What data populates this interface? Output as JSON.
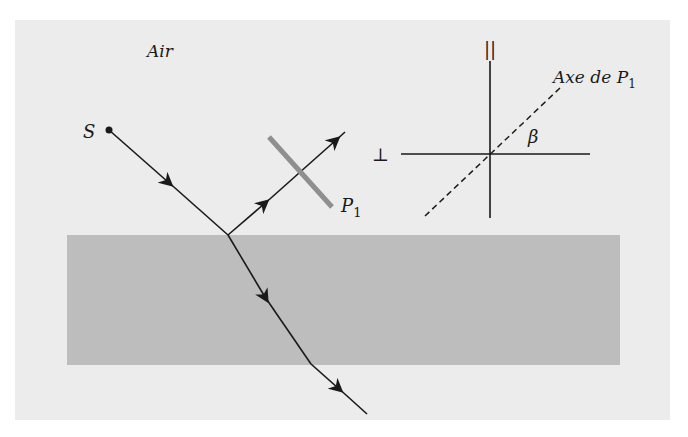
{
  "diagram": {
    "colors": {
      "background": "#ffffff",
      "air_panel": "#ececec",
      "slab": "#bdbdbd",
      "polarizer": "#8f8f8f",
      "ray": "#1a1a1a"
    },
    "labels": {
      "medium": "Air",
      "source": "S",
      "polarizer_letter": "P",
      "polarizer_sub": "1",
      "parallel_symbol": "||",
      "perp_symbol": "⊥",
      "axis_label_main": "Axe de P",
      "axis_label_sub": "1",
      "angle": "β"
    },
    "geometry": {
      "panel": {
        "x": 15,
        "y": 20,
        "w": 655,
        "h": 400
      },
      "slab": {
        "x": 67,
        "y": 235,
        "w": 553,
        "h": 130
      },
      "source_point": {
        "x": 109,
        "y": 130
      },
      "incidence_point": {
        "x": 228,
        "y": 235
      },
      "reflected_end": {
        "x": 345,
        "y": 132
      },
      "exit_point": {
        "x": 311,
        "y": 364
      },
      "transmitted_end": {
        "x": 367,
        "y": 414
      },
      "polarizer_line": {
        "x1": 269,
        "y1": 137,
        "x2": 332,
        "y2": 207
      },
      "cross_center": {
        "x": 490,
        "y": 154
      },
      "vertical_axis": {
        "y1": 61,
        "y2": 218
      },
      "horizontal_axis": {
        "x1": 401,
        "x2": 590
      },
      "dashed_axis": {
        "x1": 425,
        "y1": 216,
        "x2": 560,
        "y2": 88
      }
    }
  }
}
